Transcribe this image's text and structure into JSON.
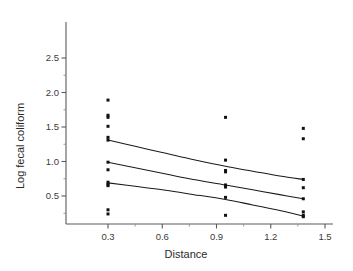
{
  "figure": {
    "background_color": "#ffffff",
    "width": 353,
    "height": 271
  },
  "axes": {
    "x_title": "Distance",
    "y_title": "Log fecal coliform",
    "x_ticks": [
      "0.3",
      "0.6",
      "0.9",
      "1.2",
      "1.5"
    ],
    "y_ticks": [
      "0.5",
      "1.0",
      "1.5",
      "2.0",
      "2.5"
    ]
  },
  "chart_data": {
    "type": "scatter",
    "title": "",
    "xlabel": "Distance",
    "ylabel": "Log fecal coliform",
    "xlim": [
      0.15,
      1.5
    ],
    "ylim": [
      0.0,
      2.8
    ],
    "xticks": [
      0.3,
      0.6,
      0.9,
      1.2,
      1.5
    ],
    "yticks": [
      0.5,
      1.0,
      1.5,
      2.0,
      2.5
    ],
    "xticks_minor": [
      0.45,
      0.75,
      1.05,
      1.35
    ],
    "yticks_minor": [
      0.25,
      0.75,
      1.25,
      1.75,
      2.25
    ],
    "grid": false,
    "legend": null,
    "marker": "square",
    "marker_color": "#111111",
    "marker_size": 3.0,
    "line_color": "#1a1a1a",
    "points": [
      {
        "x": 0.3,
        "y": 1.89
      },
      {
        "x": 0.3,
        "y": 1.67
      },
      {
        "x": 0.3,
        "y": 1.64
      },
      {
        "x": 0.3,
        "y": 1.51
      },
      {
        "x": 0.3,
        "y": 1.35
      },
      {
        "x": 0.3,
        "y": 1.31
      },
      {
        "x": 0.3,
        "y": 0.99
      },
      {
        "x": 0.3,
        "y": 0.88
      },
      {
        "x": 0.3,
        "y": 0.7
      },
      {
        "x": 0.3,
        "y": 0.67
      },
      {
        "x": 0.3,
        "y": 0.65
      },
      {
        "x": 0.3,
        "y": 0.3
      },
      {
        "x": 0.3,
        "y": 0.24
      },
      {
        "x": 0.95,
        "y": 1.64
      },
      {
        "x": 0.95,
        "y": 1.02
      },
      {
        "x": 0.95,
        "y": 0.87
      },
      {
        "x": 0.95,
        "y": 0.85
      },
      {
        "x": 0.95,
        "y": 0.66
      },
      {
        "x": 0.95,
        "y": 0.63
      },
      {
        "x": 0.95,
        "y": 0.48
      },
      {
        "x": 0.95,
        "y": 0.22
      },
      {
        "x": 1.38,
        "y": 1.48
      },
      {
        "x": 1.38,
        "y": 1.33
      },
      {
        "x": 1.38,
        "y": 0.74
      },
      {
        "x": 1.38,
        "y": 0.62
      },
      {
        "x": 1.38,
        "y": 0.46
      },
      {
        "x": 1.38,
        "y": 0.27
      },
      {
        "x": 1.38,
        "y": 0.22
      },
      {
        "x": 1.38,
        "y": 0.2
      }
    ],
    "curves": [
      {
        "name": "upper-confidence-band",
        "x": [
          0.3,
          0.45,
          0.6,
          0.75,
          0.95,
          1.1,
          1.25,
          1.38
        ],
        "y": [
          1.31,
          1.22,
          1.13,
          1.04,
          0.93,
          0.86,
          0.79,
          0.74
        ]
      },
      {
        "name": "fitted-regression-line",
        "x": [
          0.3,
          0.45,
          0.6,
          0.75,
          0.95,
          1.1,
          1.25,
          1.38
        ],
        "y": [
          0.99,
          0.91,
          0.83,
          0.75,
          0.66,
          0.59,
          0.52,
          0.46
        ]
      },
      {
        "name": "lower-confidence-band",
        "x": [
          0.3,
          0.45,
          0.6,
          0.75,
          0.95,
          1.1,
          1.25,
          1.38
        ],
        "y": [
          0.69,
          0.64,
          0.59,
          0.53,
          0.45,
          0.37,
          0.29,
          0.21
        ]
      }
    ]
  }
}
